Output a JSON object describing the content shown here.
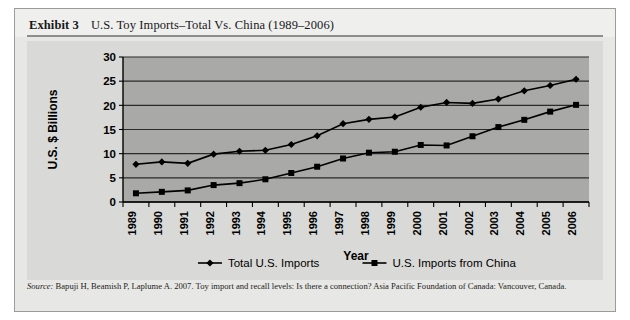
{
  "exhibit": {
    "label": "Exhibit 3",
    "title": "U.S. Toy Imports–Total Vs. China (1989–2006)"
  },
  "source": {
    "prefix": "Source:",
    "text": " Bapuji H, Beamish P, Laplume A. 2007. Toy import and recall levels: Is there a connection? Asia Pacific Foundation of Canada: Vancouver, Canada."
  },
  "colors": {
    "plot_background": "#a9a9a7",
    "card_background": "#d9d9d7",
    "page_background": "#e7e7e5",
    "header_background": "#efefed",
    "series_line": "#000000",
    "gridline": "#2b2b2b",
    "axis": "#000000",
    "text": "#000000"
  },
  "chart_data": {
    "type": "line",
    "title": "",
    "xlabel": "Year",
    "ylabel": "U.S. $ Billions",
    "categories": [
      "1989",
      "1990",
      "1991",
      "1992",
      "1993",
      "1994",
      "1995",
      "1996",
      "1997",
      "1998",
      "1999",
      "2000",
      "2001",
      "2002",
      "2003",
      "2004",
      "2005",
      "2006"
    ],
    "ylim": [
      0,
      30
    ],
    "yticks": [
      0,
      5,
      10,
      15,
      20,
      25,
      30
    ],
    "grid": true,
    "legend_position": "bottom",
    "series": [
      {
        "name": "Total U.S. Imports",
        "marker": "diamond",
        "values": [
          7.8,
          8.3,
          8.0,
          9.9,
          10.5,
          10.7,
          11.9,
          13.7,
          16.2,
          17.1,
          17.6,
          19.6,
          20.6,
          20.4,
          21.3,
          23.0,
          24.1,
          25.4
        ]
      },
      {
        "name": "U.S. Imports from China",
        "marker": "square",
        "values": [
          1.8,
          2.1,
          2.4,
          3.5,
          3.9,
          4.7,
          6.0,
          7.3,
          9.0,
          10.2,
          10.4,
          11.8,
          11.7,
          13.6,
          15.5,
          17.0,
          18.7,
          20.1
        ]
      }
    ]
  }
}
